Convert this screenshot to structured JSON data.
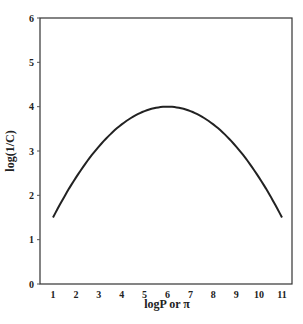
{
  "chart_data": {
    "type": "line",
    "title": "",
    "xlabel": "logP or π",
    "ylabel": "log(1/C)",
    "xlim": [
      0.4,
      11.4
    ],
    "ylim": [
      0,
      6
    ],
    "xticks": [
      1,
      2,
      3,
      4,
      5,
      6,
      7,
      8,
      9,
      10,
      11
    ],
    "yticks": [
      0,
      1,
      2,
      3,
      4,
      5,
      6
    ],
    "grid": false,
    "legend": null,
    "series": [
      {
        "name": "parabolic relationship",
        "x": [
          1,
          2,
          3,
          4,
          5,
          6,
          7,
          8,
          9,
          10,
          11
        ],
        "values": [
          1.5,
          2.4,
          3.1,
          3.6,
          3.9,
          4.0,
          3.9,
          3.6,
          3.1,
          2.4,
          1.5
        ]
      }
    ],
    "line_color": "#222222"
  }
}
